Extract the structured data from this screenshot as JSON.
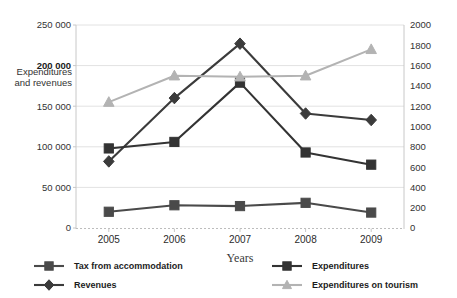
{
  "chart_data": {
    "type": "line",
    "title": "",
    "subtitle": "",
    "xlabel": "Years",
    "ylabel": "Expenditures and  revenues",
    "y2label": "",
    "categories": [
      "2005",
      "2006",
      "2007",
      "2008",
      "2009"
    ],
    "ylim": [
      0,
      250000
    ],
    "y2lim": [
      0,
      2000
    ],
    "yticks": [
      "0",
      "50 000",
      "100 000",
      "150 000",
      "200 000",
      "250 000"
    ],
    "ytick_values": [
      0,
      50000,
      100000,
      150000,
      200000,
      250000
    ],
    "ytick_bold": "200 000",
    "y2ticks": [
      "0",
      "200",
      "400",
      "600",
      "800",
      "1000",
      "1200",
      "1400",
      "1600",
      "1800",
      "2000"
    ],
    "y2tick_values": [
      0,
      200,
      400,
      600,
      800,
      1000,
      1200,
      1400,
      1600,
      1800,
      2000
    ],
    "grid": true,
    "legend_position": "bottom",
    "series": [
      {
        "name": "Tax from accommodation",
        "axis": "left",
        "marker": "square",
        "color": "#4a4a4a",
        "values": [
          20000,
          28000,
          27000,
          31000,
          19000
        ]
      },
      {
        "name": "Revenues",
        "axis": "left",
        "marker": "diamond",
        "color": "#3b3b3b",
        "values": [
          82000,
          160000,
          227000,
          141000,
          133000
        ]
      },
      {
        "name": "Expenditures",
        "axis": "left",
        "marker": "square",
        "color": "#333333",
        "values": [
          98000,
          106000,
          179000,
          93000,
          78000
        ]
      },
      {
        "name": "Expenditures on tourism",
        "axis": "right",
        "marker": "triangle",
        "color": "#b3b3b3",
        "values": [
          1240,
          1500,
          1490,
          1500,
          1760
        ]
      }
    ],
    "legend": [
      {
        "label": "Tax from accommodation",
        "marker": "square",
        "color": "#4a4a4a"
      },
      {
        "label": "Revenues",
        "marker": "diamond",
        "color": "#3b3b3b"
      },
      {
        "label": "Expenditures",
        "marker": "square",
        "color": "#333333"
      },
      {
        "label": "Expenditures on tourism",
        "marker": "triangle",
        "color": "#b3b3b3"
      }
    ]
  }
}
